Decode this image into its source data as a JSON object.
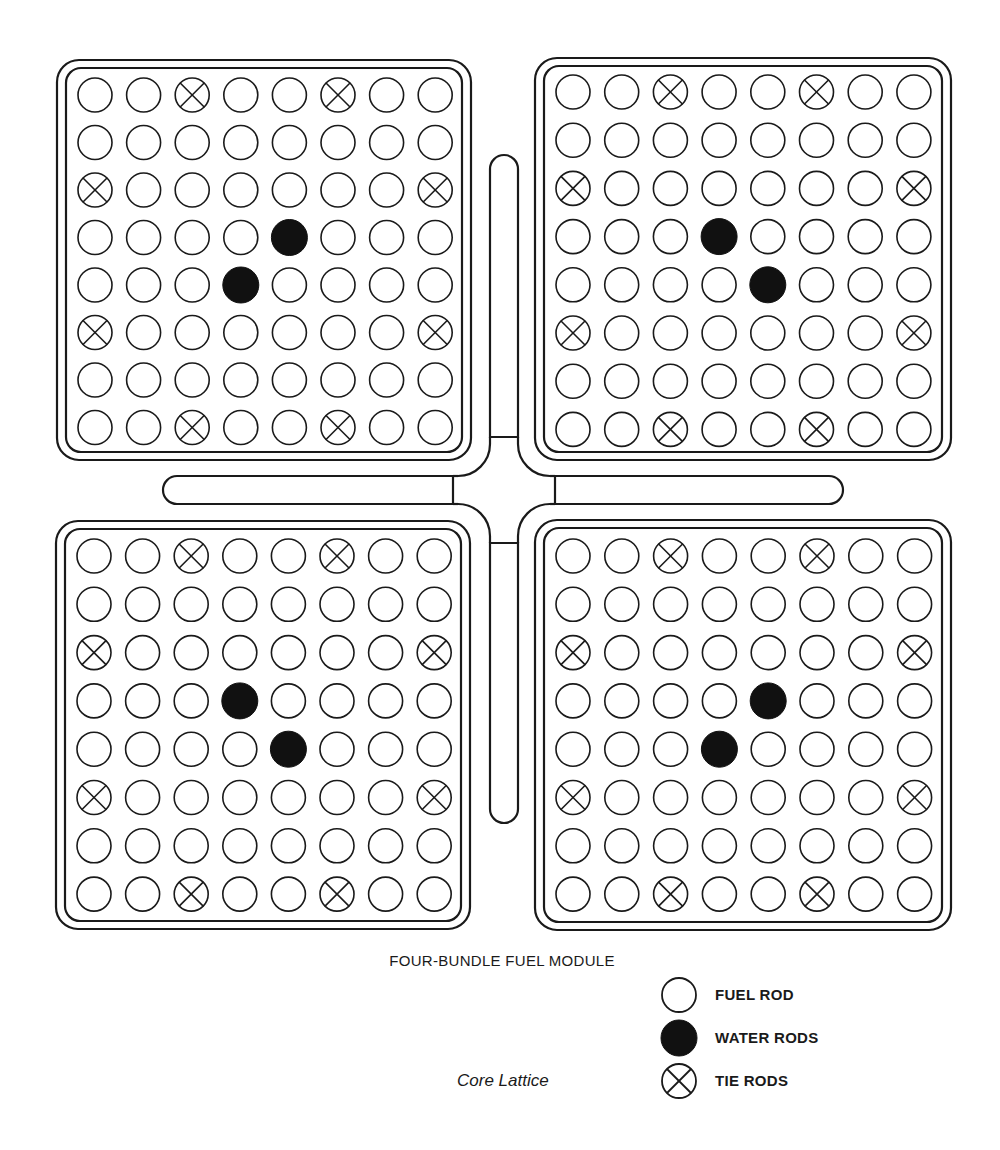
{
  "title": "FOUR-BUNDLE FUEL MODULE",
  "subtitle": "Core Lattice",
  "colors": {
    "line": "#1a1a1a",
    "background": "#ffffff",
    "water_rod_fill": "#111111"
  },
  "legend": [
    {
      "symbol": "fuel-rod",
      "label": "FUEL ROD"
    },
    {
      "symbol": "water-rod",
      "label": "WATER RODS"
    },
    {
      "symbol": "tie-rod",
      "label": "TIE RODS"
    }
  ],
  "lattice": {
    "rows": 8,
    "cols": 8,
    "rod_radius": 17,
    "tie_rods": [
      [
        0,
        2
      ],
      [
        0,
        5
      ],
      [
        2,
        0
      ],
      [
        2,
        7
      ],
      [
        5,
        0
      ],
      [
        5,
        7
      ],
      [
        7,
        2
      ],
      [
        7,
        5
      ]
    ]
  },
  "bundles": [
    {
      "name": "top-left",
      "frame": {
        "x": 57,
        "y": 60,
        "w": 414,
        "h": 400
      },
      "first_rod": {
        "x": 95,
        "y": 95
      },
      "pitch": {
        "x": 48.6,
        "y": 47.5
      },
      "water_rods": [
        [
          3,
          4
        ],
        [
          4,
          3
        ]
      ]
    },
    {
      "name": "top-right",
      "frame": {
        "x": 535,
        "y": 58,
        "w": 416,
        "h": 402
      },
      "first_rod": {
        "x": 573,
        "y": 92
      },
      "pitch": {
        "x": 48.7,
        "y": 48.2
      },
      "water_rods": [
        [
          3,
          3
        ],
        [
          4,
          4
        ]
      ]
    },
    {
      "name": "bottom-left",
      "frame": {
        "x": 56,
        "y": 521,
        "w": 414,
        "h": 408
      },
      "first_rod": {
        "x": 94,
        "y": 556
      },
      "pitch": {
        "x": 48.6,
        "y": 48.3
      },
      "water_rods": [
        [
          3,
          3
        ],
        [
          4,
          4
        ]
      ]
    },
    {
      "name": "bottom-right",
      "frame": {
        "x": 535,
        "y": 520,
        "w": 416,
        "h": 410
      },
      "first_rod": {
        "x": 573,
        "y": 556
      },
      "pitch": {
        "x": 48.8,
        "y": 48.3
      },
      "water_rods": [
        [
          3,
          4
        ],
        [
          4,
          3
        ]
      ]
    }
  ],
  "control_blade": {
    "center": {
      "x": 504,
      "y": 490
    },
    "arm_half_width": 14,
    "top_end": 155,
    "bottom_end": 823,
    "left_end": 163,
    "right_end": 843,
    "top_hub": 437,
    "bottom_hub": 543,
    "left_hub": 453,
    "right_hub": 555
  }
}
